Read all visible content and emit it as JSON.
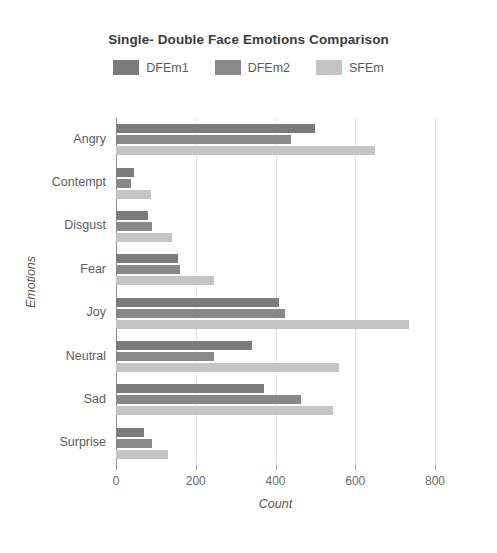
{
  "chart_data": {
    "type": "bar",
    "orientation": "horizontal",
    "title": "Single- Double Face Emotions Comparison",
    "xlabel": "Count",
    "ylabel": "Emotions",
    "categories": [
      "Angry",
      "Contempt",
      "Disgust",
      "Fear",
      "Joy",
      "Neutral",
      "Sad",
      "Surprise"
    ],
    "series": [
      {
        "name": "DFEm1",
        "color": "#7b7b7b",
        "values": [
          500,
          45,
          80,
          155,
          410,
          340,
          370,
          70
        ]
      },
      {
        "name": "DFEm2",
        "color": "#888888",
        "values": [
          440,
          38,
          90,
          160,
          425,
          245,
          465,
          90
        ]
      },
      {
        "name": "SFEm",
        "color": "#c4c4c4",
        "values": [
          650,
          88,
          140,
          245,
          735,
          560,
          545,
          130
        ]
      }
    ],
    "xlim": [
      0,
      800
    ],
    "xticks": [
      0,
      200,
      400,
      600,
      800
    ],
    "xtick_labels": [
      "0",
      "200",
      "400",
      "600",
      "800"
    ],
    "grid": true,
    "legend_position": "top-center"
  }
}
